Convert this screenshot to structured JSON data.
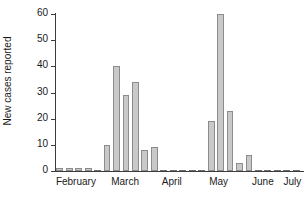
{
  "chart_data": {
    "type": "bar",
    "title": "",
    "xlabel": "",
    "ylabel": "New cases reported",
    "ylim": [
      0,
      60
    ],
    "ytick_values": [
      0,
      10,
      20,
      30,
      40,
      50,
      60
    ],
    "ytick_labels": [
      "0",
      "10",
      "20",
      "30",
      "40",
      "50",
      "60"
    ],
    "grid": false,
    "legend": null,
    "x_axis_type": "time-weeks",
    "month_labels": [
      "February",
      "March",
      "April",
      "May",
      "June",
      "July"
    ],
    "month_label_positions": [
      0.085,
      0.285,
      0.475,
      0.665,
      0.845,
      0.965
    ],
    "categories": [
      "1",
      "2",
      "3",
      "4",
      "5",
      "6",
      "7",
      "8",
      "9",
      "10",
      "11",
      "12",
      "13",
      "14",
      "15",
      "16",
      "17",
      "18",
      "19",
      "20",
      "21",
      "22",
      "23",
      "24",
      "25",
      "26"
    ],
    "values": [
      1,
      1,
      1,
      1,
      0,
      10,
      40,
      29,
      34,
      8,
      9,
      0,
      0,
      0,
      0,
      0,
      19,
      60,
      23,
      3,
      6,
      0,
      0,
      0,
      0,
      0
    ],
    "bar_color": "#c9c9c9",
    "bar_edge_color": "#8c8c8c",
    "axis_color": "#3c3c3c"
  }
}
